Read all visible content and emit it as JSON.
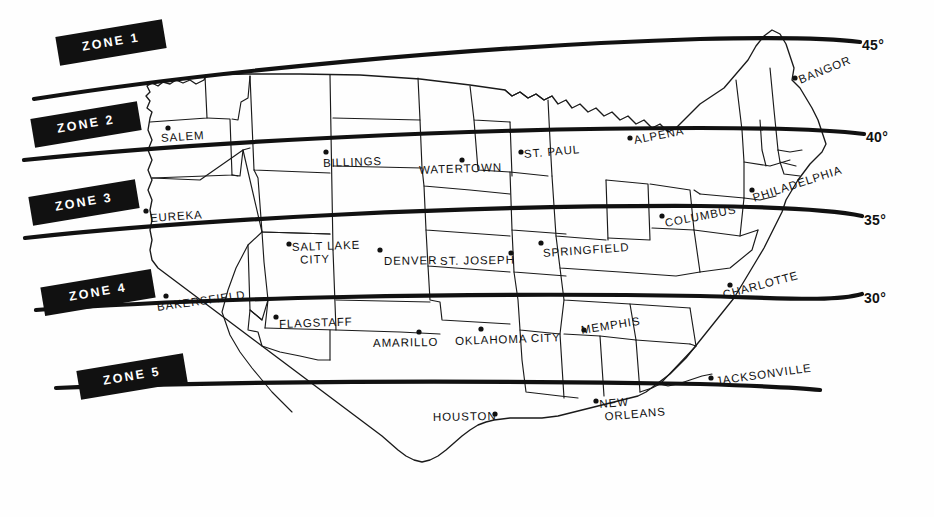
{
  "map": {
    "title": "United States Climate Zone Map",
    "zones": [
      {
        "id": "zone-1",
        "label": "ZONE 1"
      },
      {
        "id": "zone-2",
        "label": "ZONE 2"
      },
      {
        "id": "zone-3",
        "label": "ZONE 3"
      },
      {
        "id": "zone-4",
        "label": "ZONE 4"
      },
      {
        "id": "zone-5",
        "label": "ZONE 5"
      }
    ],
    "latitude_lines": [
      {
        "id": "lat-45",
        "label": "45°",
        "value": 45
      },
      {
        "id": "lat-40",
        "label": "40°",
        "value": 40
      },
      {
        "id": "lat-35",
        "label": "35°",
        "value": 35
      },
      {
        "id": "lat-30",
        "label": "30°",
        "value": 30
      }
    ],
    "cities": [
      {
        "id": "salem",
        "label": "SALEM",
        "zone": 2
      },
      {
        "id": "billings",
        "label": "BILLINGS",
        "zone": 2
      },
      {
        "id": "watertown",
        "label": "WATERTOWN",
        "zone": 2
      },
      {
        "id": "st-paul",
        "label": "ST. PAUL",
        "zone": 2
      },
      {
        "id": "alpena",
        "label": "ALPENA",
        "zone": 2
      },
      {
        "id": "bangor",
        "label": "BANGOR",
        "zone": 1
      },
      {
        "id": "eureka",
        "label": "EUREKA",
        "zone": 3
      },
      {
        "id": "salt-lake-city",
        "label": "SALT LAKE CITY",
        "line1": "SALT LAKE",
        "line2": "CITY",
        "zone": 3
      },
      {
        "id": "denver",
        "label": "DENVER",
        "zone": 3
      },
      {
        "id": "st-joseph",
        "label": "ST. JOSEPH",
        "zone": 3
      },
      {
        "id": "springfield",
        "label": "SPRINGFIELD",
        "zone": 3
      },
      {
        "id": "columbus",
        "label": "COLUMBUS",
        "zone": 3
      },
      {
        "id": "philadelphia",
        "label": "PHILADELPHIA",
        "zone": 3
      },
      {
        "id": "bakersfield",
        "label": "BAKERSFIELD",
        "zone": 4
      },
      {
        "id": "flagstaff",
        "label": "FLAGSTAFF",
        "zone": 4
      },
      {
        "id": "amarillo",
        "label": "AMARILLO",
        "zone": 4
      },
      {
        "id": "oklahoma-city",
        "label": "OKLAHOMA CITY",
        "zone": 4
      },
      {
        "id": "memphis",
        "label": "MEMPHIS",
        "zone": 4
      },
      {
        "id": "charlotte",
        "label": "CHARLOTTE",
        "zone": 4
      },
      {
        "id": "houston",
        "label": "HOUSTON",
        "zone": 5
      },
      {
        "id": "new-orleans",
        "label": "NEW ORLEANS",
        "line1": "NEW",
        "line2": "ORLEANS",
        "zone": 5
      },
      {
        "id": "jacksonville",
        "label": "JACKSONVILLE",
        "zone": 5
      }
    ],
    "colors": {
      "ink": "#111111",
      "paper": "#ffffff",
      "zone_tag_background": "#111111",
      "zone_tag_text": "#ffffff"
    }
  }
}
